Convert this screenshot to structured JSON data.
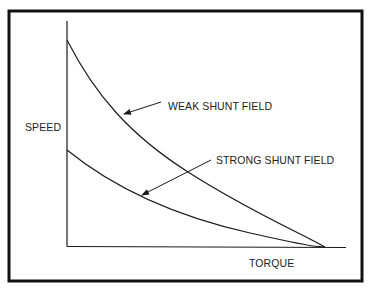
{
  "diagram": {
    "title": "",
    "axes": {
      "y_label": "SPEED",
      "x_label": "TORQUE"
    },
    "curves": [
      {
        "name": "weak-shunt-field",
        "label": "WEAK SHUNT FIELD"
      },
      {
        "name": "strong-shunt-field",
        "label": "STRONG SHUNT FIELD"
      }
    ],
    "colors": {
      "line": "#1a1a1a",
      "border": "#111111",
      "background": "#ffffff"
    }
  }
}
